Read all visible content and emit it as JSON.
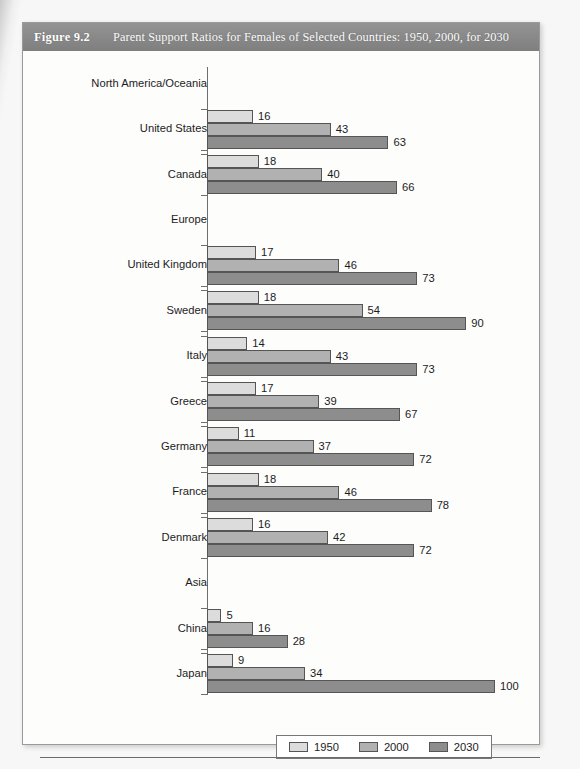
{
  "figure": {
    "number": "Figure 9.2",
    "title": "Parent Support Ratios for Females of Selected Countries: 1950, 2000, for 2030"
  },
  "chart_data": {
    "type": "bar",
    "orientation": "horizontal",
    "title": "Parent Support Ratios for Females of Selected Countries: 1950, 2000, for 2030",
    "xlabel": "",
    "ylabel": "",
    "xlim": [
      0,
      100
    ],
    "grid": false,
    "legend_position": "bottom-center",
    "legend": [
      "1950",
      "2000",
      "2030"
    ],
    "series": [
      {
        "name": "1950",
        "color": "#dcdcdc"
      },
      {
        "name": "2000",
        "color": "#b1b1b1"
      },
      {
        "name": "2030",
        "color": "#8d8d8d"
      }
    ],
    "groups": [
      {
        "label": "North America/Oceania",
        "is_header": true,
        "values": []
      },
      {
        "label": "United States",
        "is_header": false,
        "values": [
          16,
          43,
          63
        ]
      },
      {
        "label": "Canada",
        "is_header": false,
        "values": [
          18,
          40,
          66
        ]
      },
      {
        "label": "Europe",
        "is_header": true,
        "values": []
      },
      {
        "label": "United Kingdom",
        "is_header": false,
        "values": [
          17,
          46,
          73
        ]
      },
      {
        "label": "Sweden",
        "is_header": false,
        "values": [
          18,
          54,
          90
        ]
      },
      {
        "label": "Italy",
        "is_header": false,
        "values": [
          14,
          43,
          73
        ]
      },
      {
        "label": "Greece",
        "is_header": false,
        "values": [
          17,
          39,
          67
        ]
      },
      {
        "label": "Germany",
        "is_header": false,
        "values": [
          11,
          37,
          72
        ]
      },
      {
        "label": "France",
        "is_header": false,
        "values": [
          18,
          46,
          78
        ]
      },
      {
        "label": "Denmark",
        "is_header": false,
        "values": [
          16,
          42,
          72
        ]
      },
      {
        "label": "Asia",
        "is_header": true,
        "values": []
      },
      {
        "label": "China",
        "is_header": false,
        "values": [
          5,
          16,
          28
        ]
      },
      {
        "label": "Japan",
        "is_header": false,
        "values": [
          9,
          34,
          100
        ]
      }
    ]
  }
}
